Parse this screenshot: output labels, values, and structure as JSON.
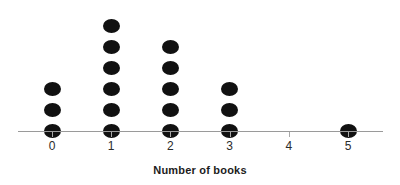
{
  "chart_data": {
    "type": "scatter",
    "plot_style": "dot-plot",
    "title": "",
    "xlabel": "Number of books",
    "ylabel": "",
    "categories": [
      "0",
      "1",
      "2",
      "3",
      "4",
      "5"
    ],
    "values": [
      3,
      6,
      5,
      3,
      0,
      1
    ],
    "total_count": 18,
    "xlim": [
      -0.6,
      5.6
    ],
    "ylim": [
      0,
      6
    ],
    "grid": false,
    "legend": null,
    "annotations": [],
    "dot_color": "#111111",
    "axis_color": "#9a9a9a",
    "background_color": "#ffffff",
    "tick_labels": [
      "0",
      "1",
      "2",
      "3",
      "4",
      "5"
    ],
    "series": [
      {
        "name": "Number of books",
        "categories": [
          "0",
          "1",
          "2",
          "3",
          "4",
          "5"
        ],
        "values": [
          3,
          6,
          5,
          3,
          0,
          1
        ]
      }
    ]
  },
  "axis": {
    "title": "Number of books"
  }
}
